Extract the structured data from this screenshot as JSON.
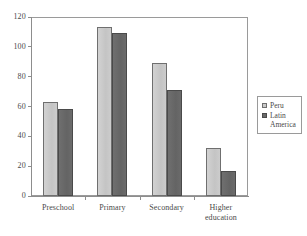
{
  "chart_data": {
    "type": "bar",
    "title": "",
    "subtitle": "",
    "xlabel": "",
    "ylabel": "",
    "categories": [
      "Preschool",
      "Primary",
      "Secondary",
      "Higher\neducation"
    ],
    "series": [
      {
        "name": "Peru",
        "values": [
          63,
          113,
          89,
          32
        ],
        "color": "#c9c9c9"
      },
      {
        "name": "Latin\nAmerica",
        "values": [
          58,
          109,
          71,
          17
        ],
        "color": "#6a6a6a"
      }
    ],
    "ylim": [
      0,
      120
    ],
    "yticks": [
      0,
      20,
      40,
      60,
      80,
      100,
      120
    ],
    "ytick_labels": [
      "0",
      "20",
      "40",
      "60",
      "80",
      "100",
      "120"
    ],
    "grid": false,
    "legend_position": "right",
    "frame": true
  },
  "legend": {
    "entries": [
      {
        "label": "Peru",
        "swatch": "legend-swatch-peru"
      },
      {
        "label": "Latin\nAmerica",
        "swatch": "legend-swatch-latin-america"
      }
    ]
  }
}
